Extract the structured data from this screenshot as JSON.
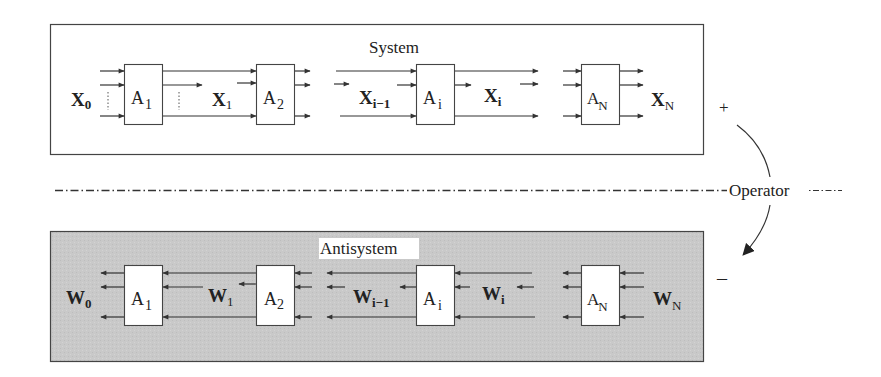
{
  "system": {
    "title": "System",
    "background": "#ffffff",
    "blocks": [
      {
        "main": "A",
        "sub": "1"
      },
      {
        "main": "A",
        "sub": "2"
      },
      {
        "main": "A",
        "sub": "i"
      },
      {
        "main": "A",
        "sub": "N"
      }
    ],
    "signals": [
      {
        "main": "X",
        "sub": "0"
      },
      {
        "main": "X",
        "sub": "1"
      },
      {
        "main": "X",
        "sub": "i−1"
      },
      {
        "main": "X",
        "sub": "i"
      },
      {
        "main": "X",
        "sub": "N"
      }
    ],
    "sign": "+"
  },
  "antisystem": {
    "title": "Antisystem",
    "background": "#c8c8c8",
    "blocks": [
      {
        "main": "A",
        "sub": "1"
      },
      {
        "main": "A",
        "sub": "2"
      },
      {
        "main": "A",
        "sub": "i"
      },
      {
        "main": "A",
        "sub": "N"
      }
    ],
    "signals": [
      {
        "main": "W",
        "sub": "0"
      },
      {
        "main": "W",
        "sub": "1"
      },
      {
        "main": "W",
        "sub": "i−1"
      },
      {
        "main": "W",
        "sub": "i"
      },
      {
        "main": "W",
        "sub": "N"
      }
    ],
    "sign": "–"
  },
  "operator": {
    "label": "Operator",
    "line_style": "dash-dot"
  }
}
